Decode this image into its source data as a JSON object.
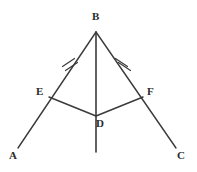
{
  "figure": {
    "type": "geometry-diagram",
    "background_color": "#ffffff",
    "stroke_color": "#3a3a3a",
    "label_color": "#2b2b2b",
    "width": 197,
    "height": 172
  },
  "points": [
    {
      "id": "B",
      "label": "B",
      "x": 96,
      "y": 32,
      "label_x": 92,
      "label_y": 11
    },
    {
      "id": "E",
      "label": "E",
      "x": 49,
      "y": 97,
      "label_x": 36,
      "label_y": 86
    },
    {
      "id": "F",
      "label": "F",
      "x": 143,
      "y": 97,
      "label_x": 147,
      "label_y": 86
    },
    {
      "id": "D",
      "label": "D",
      "x": 96,
      "y": 116,
      "label_x": 96,
      "label_y": 118
    },
    {
      "id": "A",
      "label": "A",
      "x": 18,
      "y": 148,
      "label_x": 9,
      "label_y": 150
    },
    {
      "id": "C",
      "label": "C",
      "x": 176,
      "y": 148,
      "label_x": 177,
      "label_y": 150
    }
  ],
  "segments": [
    {
      "id": "BA",
      "from": "B",
      "to": "A",
      "ticks": 0
    },
    {
      "id": "BC",
      "from": "B",
      "to": "C",
      "ticks": 0
    },
    {
      "id": "ED",
      "from": "E",
      "to": "D",
      "ticks": 0
    },
    {
      "id": "DF",
      "from": "D",
      "to": "F",
      "ticks": 0
    },
    {
      "id": "BD-extended",
      "from": "B",
      "to": "vertical-bottom",
      "ticks": 0
    }
  ],
  "tick_marks": [
    {
      "id": "tick-BE",
      "on_segment": "BE",
      "count": 2,
      "x": 70,
      "y": 63
    },
    {
      "id": "tick-BF",
      "on_segment": "BF",
      "count": 2,
      "x": 122,
      "y": 63
    }
  ],
  "vertical_line": {
    "id": "median-BD",
    "top_x": 96,
    "top_y": 32,
    "bottom_x": 96,
    "bottom_y": 152
  },
  "labels": {
    "B": "B",
    "E": "E",
    "F": "F",
    "D": "D",
    "A": "A",
    "C": "C"
  }
}
